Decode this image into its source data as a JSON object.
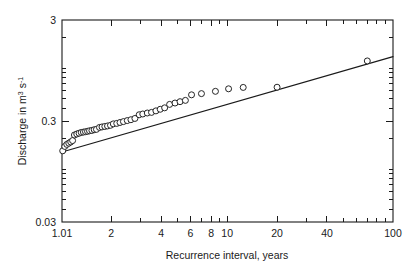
{
  "chart_data": {
    "type": "scatter",
    "title": "",
    "xlabel": "Recurrence interval, years",
    "ylabel": "Discharge in m3 s-1",
    "ylabel_parts": {
      "lead": "Discharge in m",
      "sup1": "3",
      "mid": " s",
      "sup2": "-1"
    },
    "xscale": "log",
    "yscale": "log",
    "xlim": [
      1.01,
      100
    ],
    "ylim": [
      0.03,
      3
    ],
    "grid": false,
    "legend": null,
    "xticklabels": [
      "1.01",
      "2",
      "4",
      "6",
      "8",
      "10",
      "20",
      "40",
      "100"
    ],
    "xtickvalues": [
      1.01,
      2,
      4,
      6,
      8,
      10,
      20,
      40,
      100
    ],
    "yticklabels": [
      "3",
      "0.3",
      "0.03"
    ],
    "ytickvalues": [
      3,
      0.3,
      0.03
    ],
    "xminorticks": [
      3,
      5,
      7,
      9,
      30,
      50,
      60,
      70,
      80,
      90
    ],
    "yminorticks": [
      0.04,
      0.05,
      0.06,
      0.07,
      0.08,
      0.09,
      0.1,
      0.2,
      0.4,
      0.5,
      0.6,
      0.7,
      0.8,
      0.9,
      1,
      2
    ],
    "series": [
      {
        "name": "Annual peak discharge",
        "marker": "open-circle",
        "points": [
          [
            1.02,
            0.152
          ],
          [
            1.05,
            0.168
          ],
          [
            1.08,
            0.176
          ],
          [
            1.11,
            0.181
          ],
          [
            1.14,
            0.186
          ],
          [
            1.17,
            0.192
          ],
          [
            1.2,
            0.218
          ],
          [
            1.24,
            0.223
          ],
          [
            1.28,
            0.227
          ],
          [
            1.32,
            0.231
          ],
          [
            1.36,
            0.233
          ],
          [
            1.4,
            0.235
          ],
          [
            1.44,
            0.237
          ],
          [
            1.48,
            0.24
          ],
          [
            1.53,
            0.242
          ],
          [
            1.58,
            0.246
          ],
          [
            1.63,
            0.248
          ],
          [
            1.7,
            0.259
          ],
          [
            1.76,
            0.262
          ],
          [
            1.83,
            0.265
          ],
          [
            1.9,
            0.268
          ],
          [
            1.98,
            0.272
          ],
          [
            2.06,
            0.281
          ],
          [
            2.16,
            0.284
          ],
          [
            2.26,
            0.29
          ],
          [
            2.37,
            0.296
          ],
          [
            2.5,
            0.303
          ],
          [
            2.63,
            0.309
          ],
          [
            2.78,
            0.318
          ],
          [
            2.95,
            0.346
          ],
          [
            3.1,
            0.352
          ],
          [
            3.3,
            0.36
          ],
          [
            3.5,
            0.365
          ],
          [
            3.72,
            0.378
          ],
          [
            3.95,
            0.392
          ],
          [
            4.2,
            0.405
          ],
          [
            4.5,
            0.438
          ],
          [
            4.85,
            0.452
          ],
          [
            5.2,
            0.466
          ],
          [
            5.6,
            0.48
          ],
          [
            6.1,
            0.545
          ],
          [
            7.0,
            0.56
          ],
          [
            8.5,
            0.59
          ],
          [
            10.2,
            0.625
          ],
          [
            12.5,
            0.645
          ],
          [
            20.0,
            0.648
          ],
          [
            70.0,
            1.18
          ]
        ]
      }
    ],
    "fit_line": {
      "name": "Fitted frequency curve",
      "type": "log-log-linear",
      "endpoints": [
        [
          1.01,
          0.148
        ],
        [
          100,
          1.3
        ]
      ]
    }
  },
  "axis_titles": {
    "x": "Recurrence interval, years",
    "y": "Discharge in m"
  }
}
